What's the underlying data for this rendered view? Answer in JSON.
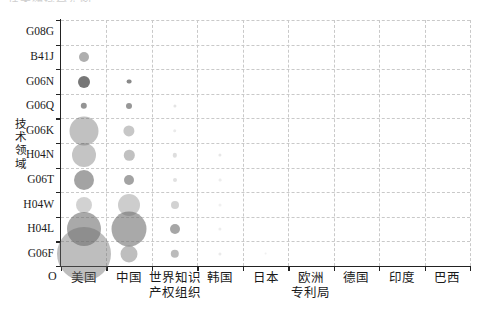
{
  "chart_data": {
    "type": "scatter",
    "title": "",
    "xlabel": "",
    "ylabel": "技术领域",
    "origin_label": "O",
    "grid": true,
    "legend": null,
    "categories_x": [
      "美国",
      "中国",
      "世界知识\n产权组织",
      "韩国",
      "日本",
      "欧洲\n专利局",
      "德国",
      "印度",
      "巴西"
    ],
    "categories_y": [
      "G08G",
      "B41J",
      "G06N",
      "G06Q",
      "G06K",
      "H04N",
      "G06T",
      "H04W",
      "H04L",
      "G06F"
    ],
    "bubble_color": "#6b6b6b",
    "points": [
      {
        "x": "美国",
        "y": "B41J",
        "size": 5.0,
        "opacity": 0.55
      },
      {
        "x": "美国",
        "y": "G06N",
        "size": 6.0,
        "opacity": 0.92
      },
      {
        "x": "中国",
        "y": "G06N",
        "size": 2.4,
        "opacity": 0.8
      },
      {
        "x": "美国",
        "y": "G06Q",
        "size": 3.2,
        "opacity": 0.72
      },
      {
        "x": "中国",
        "y": "G06Q",
        "size": 3.0,
        "opacity": 0.7
      },
      {
        "x": "世界知识\n产权组织",
        "y": "G06Q",
        "size": 1.6,
        "opacity": 0.18
      },
      {
        "x": "美国",
        "y": "G06K",
        "size": 14.5,
        "opacity": 0.42
      },
      {
        "x": "中国",
        "y": "G06K",
        "size": 5.6,
        "opacity": 0.38
      },
      {
        "x": "世界知识\n产权组织",
        "y": "G06K",
        "size": 1.8,
        "opacity": 0.14
      },
      {
        "x": "美国",
        "y": "H04N",
        "size": 12.0,
        "opacity": 0.4
      },
      {
        "x": "中国",
        "y": "H04N",
        "size": 5.2,
        "opacity": 0.42
      },
      {
        "x": "世界知识\n产权组织",
        "y": "H04N",
        "size": 2.2,
        "opacity": 0.22
      },
      {
        "x": "韩国",
        "y": "H04N",
        "size": 1.6,
        "opacity": 0.16
      },
      {
        "x": "美国",
        "y": "G06T",
        "size": 10.0,
        "opacity": 0.62
      },
      {
        "x": "中国",
        "y": "G06T",
        "size": 5.0,
        "opacity": 0.62
      },
      {
        "x": "世界知识\n产权组织",
        "y": "G06T",
        "size": 2.0,
        "opacity": 0.2
      },
      {
        "x": "韩国",
        "y": "G06T",
        "size": 1.4,
        "opacity": 0.12
      },
      {
        "x": "美国",
        "y": "H04W",
        "size": 8.0,
        "opacity": 0.3
      },
      {
        "x": "中国",
        "y": "H04W",
        "size": 11.0,
        "opacity": 0.34
      },
      {
        "x": "世界知识\n产权组织",
        "y": "H04W",
        "size": 4.0,
        "opacity": 0.3
      },
      {
        "x": "韩国",
        "y": "H04W",
        "size": 1.5,
        "opacity": 0.1
      },
      {
        "x": "美国",
        "y": "H04L",
        "size": 17.0,
        "opacity": 0.58
      },
      {
        "x": "中国",
        "y": "H04L",
        "size": 17.5,
        "opacity": 0.58
      },
      {
        "x": "世界知识\n产权组织",
        "y": "H04L",
        "size": 5.0,
        "opacity": 0.6
      },
      {
        "x": "韩国",
        "y": "H04L",
        "size": 1.6,
        "opacity": 0.12
      },
      {
        "x": "美国",
        "y": "G06F",
        "size": 27.0,
        "opacity": 0.44
      },
      {
        "x": "中国",
        "y": "G06F",
        "size": 8.5,
        "opacity": 0.44
      },
      {
        "x": "世界知识\n产权组织",
        "y": "G06F",
        "size": 4.2,
        "opacity": 0.46
      },
      {
        "x": "韩国",
        "y": "G06F",
        "size": 1.6,
        "opacity": 0.14
      },
      {
        "x": "日本",
        "y": "G06F",
        "size": 1.4,
        "opacity": 0.1
      }
    ]
  },
  "top_clipped_text": "技术领域分布图"
}
